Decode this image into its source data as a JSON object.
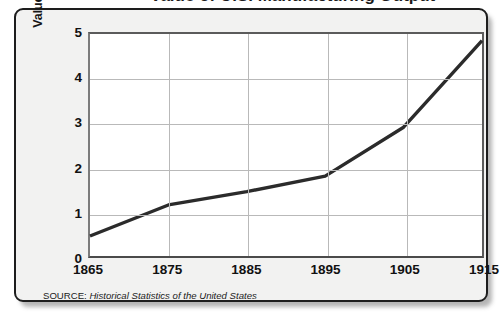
{
  "figure": {
    "title_partial": "Value of U.S. Manufacturing Output",
    "source_label": "SOURCE:",
    "source_title": "Historical Statistics of the United States"
  },
  "chart_data": {
    "type": "line",
    "title": "",
    "xlabel": "",
    "ylabel": "Value (in billions of dollars)",
    "x": [
      1865,
      1875,
      1885,
      1895,
      1905,
      1915
    ],
    "values": [
      0.45,
      1.15,
      1.45,
      1.8,
      2.9,
      4.85
    ],
    "xticklabels": [
      "1865",
      "1875",
      "1885",
      "1895",
      "1905",
      "1915"
    ],
    "yticklabels": [
      "0",
      "1",
      "2",
      "3",
      "4",
      "5"
    ],
    "xlim": [
      1865,
      1915
    ],
    "ylim": [
      0,
      5
    ],
    "grid": true,
    "legend": "none",
    "line_color": "#2b2b2b",
    "line_width": 3.4,
    "plot_background": "#ffffff",
    "panel_background": "#f2f2f1",
    "grid_color": "#b9b9b9"
  }
}
